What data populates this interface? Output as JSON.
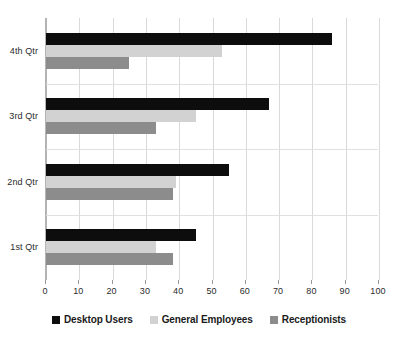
{
  "chart_data": {
    "type": "bar",
    "orientation": "horizontal",
    "title": "",
    "xlabel": "",
    "ylabel": "",
    "categories": [
      "1st Qtr",
      "2nd Qtr",
      "3rd Qtr",
      "4th Qtr"
    ],
    "category_order_top_to_bottom": [
      "4th Qtr",
      "3rd Qtr",
      "2nd Qtr",
      "1st Qtr"
    ],
    "series": [
      {
        "name": "Desktop Users",
        "color": "#0d0d0d",
        "values": [
          45,
          55,
          67,
          86
        ]
      },
      {
        "name": "General Employees",
        "color": "#d2d2d2",
        "values": [
          33,
          39,
          45,
          53
        ]
      },
      {
        "name": "Receptionists",
        "color": "#8c8c8c",
        "values": [
          38,
          38,
          33,
          25
        ]
      }
    ],
    "xlim": [
      0,
      100
    ],
    "xticks": [
      0,
      10,
      20,
      30,
      40,
      50,
      60,
      70,
      80,
      90,
      100
    ],
    "xtick_labels": [
      "0",
      "10",
      "20",
      "30",
      "40",
      "50",
      "60",
      "70",
      "80",
      "90",
      "100"
    ],
    "grid": {
      "vertical": true,
      "horizontal": false
    },
    "legend": {
      "position": "bottom",
      "entries": [
        "Desktop Users",
        "General Employees",
        "Receptionists"
      ]
    }
  },
  "legend": {
    "items": [
      {
        "label": "Desktop Users",
        "swatch": "legend-swatch-desktop-users"
      },
      {
        "label": "General Employees",
        "swatch": "legend-swatch-general-employees"
      },
      {
        "label": "Receptionists",
        "swatch": "legend-swatch-receptionists"
      }
    ]
  },
  "axis": {
    "x_tick_labels": [
      "0",
      "10",
      "20",
      "30",
      "40",
      "50",
      "60",
      "70",
      "80",
      "90",
      "100"
    ],
    "y_category_labels": [
      "4th Qtr",
      "3rd Qtr",
      "2nd Qtr",
      "1st Qtr"
    ]
  }
}
